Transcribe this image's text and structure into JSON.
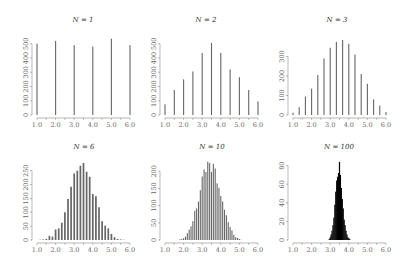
{
  "chart_data": [
    {
      "type": "bar",
      "title": "N = 1",
      "title_var": "N",
      "title_val": "1",
      "xlabel": "",
      "ylabel": "",
      "xlim": [
        1.0,
        6.0
      ],
      "xticks": [
        "1.0",
        "2.0",
        "3.0",
        "4.0",
        "5.0",
        "6.0"
      ],
      "yticks": [
        0,
        100,
        200,
        300,
        400,
        500
      ],
      "ylim": [
        0,
        540
      ],
      "x": [
        1.0,
        2.0,
        3.0,
        4.0,
        5.0,
        6.0
      ],
      "values": [
        500,
        520,
        490,
        480,
        535,
        490
      ],
      "fill": "#666666",
      "grid": false
    },
    {
      "type": "bar",
      "title": "N = 2",
      "title_var": "N",
      "title_val": "2",
      "xlabel": "",
      "ylabel": "",
      "xlim": [
        1.0,
        6.0
      ],
      "xticks": [
        "1.0",
        "2.0",
        "3.0",
        "4.0",
        "5.0",
        "6.0"
      ],
      "yticks": [
        0,
        100,
        200,
        300,
        400,
        500
      ],
      "ylim": [
        0,
        540
      ],
      "x": [
        1.0,
        1.5,
        2.0,
        2.5,
        3.0,
        3.5,
        4.0,
        4.5,
        5.0,
        5.5,
        6.0
      ],
      "values": [
        75,
        175,
        250,
        305,
        435,
        505,
        435,
        320,
        265,
        175,
        95
      ],
      "fill": "#666666",
      "grid": false
    },
    {
      "type": "bar",
      "title": "N = 3",
      "title_var": "N",
      "title_val": "3",
      "xlabel": "",
      "ylabel": "",
      "xlim": [
        1.0,
        6.0
      ],
      "xticks": [
        "1.0",
        "2.0",
        "3.0",
        "4.0",
        "5.0",
        "6.0"
      ],
      "yticks": [
        0,
        100,
        200,
        300
      ],
      "ylim": [
        0,
        395
      ],
      "x": [
        1.0,
        1.333,
        1.667,
        2.0,
        2.333,
        2.667,
        3.0,
        3.333,
        3.667,
        4.0,
        4.333,
        4.667,
        5.0,
        5.333,
        5.667,
        6.0
      ],
      "values": [
        12,
        40,
        95,
        135,
        205,
        290,
        345,
        375,
        385,
        365,
        310,
        210,
        160,
        80,
        48,
        15
      ],
      "fill": "#666666",
      "grid": false
    },
    {
      "type": "bar",
      "title": "N = 6",
      "title_var": "N",
      "title_val": "6",
      "xlabel": "",
      "ylabel": "",
      "xlim": [
        1.0,
        6.0
      ],
      "xticks": [
        "1.0",
        "2.0",
        "3.0",
        "4.0",
        "5.0",
        "6.0"
      ],
      "yticks": [
        0,
        50,
        100,
        150,
        200,
        250
      ],
      "ylim": [
        0,
        285
      ],
      "x": [
        1.167,
        1.333,
        1.5,
        1.667,
        1.833,
        2.0,
        2.167,
        2.333,
        2.5,
        2.667,
        2.833,
        3.0,
        3.167,
        3.333,
        3.5,
        3.667,
        3.833,
        4.0,
        4.167,
        4.333,
        4.5,
        4.667,
        4.833,
        5.0,
        5.167,
        5.333,
        5.5,
        5.667
      ],
      "values": [
        1,
        2,
        4,
        15,
        12,
        38,
        42,
        62,
        100,
        148,
        192,
        240,
        250,
        268,
        278,
        246,
        228,
        166,
        158,
        118,
        68,
        52,
        42,
        22,
        10,
        4,
        2,
        1
      ],
      "fill": "#666666",
      "grid": false
    },
    {
      "type": "bar",
      "title": "N = 10",
      "title_var": "N",
      "title_val": "10",
      "xlabel": "",
      "ylabel": "",
      "xlim": [
        1.0,
        6.0
      ],
      "xticks": [
        "1.0",
        "2.0",
        "3.0",
        "4.0",
        "5.0",
        "6.0"
      ],
      "yticks": [
        0,
        50,
        100,
        150,
        200
      ],
      "ylim": [
        0,
        230
      ],
      "x": [
        1.8,
        1.9,
        2.0,
        2.1,
        2.2,
        2.3,
        2.4,
        2.5,
        2.6,
        2.7,
        2.8,
        2.9,
        3.0,
        3.1,
        3.2,
        3.3,
        3.4,
        3.5,
        3.6,
        3.7,
        3.8,
        3.9,
        4.0,
        4.1,
        4.2,
        4.3,
        4.4,
        4.5,
        4.6,
        4.7,
        4.8,
        4.9,
        5.0,
        5.1
      ],
      "values": [
        2,
        3,
        5,
        10,
        20,
        30,
        40,
        55,
        85,
        92,
        112,
        145,
        185,
        205,
        198,
        228,
        224,
        198,
        222,
        208,
        165,
        152,
        128,
        112,
        88,
        72,
        52,
        38,
        28,
        15,
        8,
        6,
        3,
        1
      ],
      "fill": "#666666",
      "grid": false
    },
    {
      "type": "bar",
      "title": "N = 100",
      "title_var": "N",
      "title_val": "100",
      "xlabel": "",
      "ylabel": "",
      "xlim": [
        1.0,
        6.0
      ],
      "xticks": [
        "1.0",
        "2.0",
        "3.0",
        "4.0",
        "5.0",
        "6.0"
      ],
      "yticks": [
        0,
        20,
        40,
        60,
        80
      ],
      "ylim": [
        0,
        85
      ],
      "x": [
        2.95,
        3.0,
        3.05,
        3.1,
        3.15,
        3.2,
        3.25,
        3.3,
        3.35,
        3.4,
        3.45,
        3.5,
        3.55,
        3.6,
        3.65,
        3.7,
        3.75,
        3.8,
        3.85,
        3.9,
        3.95,
        4.0,
        4.05
      ],
      "values": [
        1,
        3,
        6,
        10,
        16,
        24,
        38,
        52,
        64,
        68,
        72,
        84,
        70,
        56,
        44,
        34,
        22,
        16,
        10,
        6,
        3,
        2,
        1
      ],
      "fill": "#000000",
      "grid": false
    }
  ],
  "layout": {
    "panels": [
      {
        "x0": 37,
        "x1": 130,
        "ybase": 115,
        "ytop": 38,
        "yaxis_x": 32,
        "title_x": 83,
        "title_y": 22
      },
      {
        "x0": 165,
        "x1": 258,
        "ybase": 115,
        "ytop": 38,
        "yaxis_x": 160,
        "title_x": 206,
        "title_y": 22
      },
      {
        "x0": 293,
        "x1": 386,
        "ybase": 115,
        "ytop": 38,
        "yaxis_x": 288,
        "title_x": 337,
        "title_y": 22
      },
      {
        "x0": 37,
        "x1": 130,
        "ybase": 240,
        "ytop": 161,
        "yaxis_x": 32,
        "title_x": 84,
        "title_y": 149
      },
      {
        "x0": 165,
        "x1": 258,
        "ybase": 240,
        "ytop": 161,
        "yaxis_x": 160,
        "title_x": 212,
        "title_y": 149
      },
      {
        "x0": 293,
        "x1": 386,
        "ybase": 240,
        "ytop": 161,
        "yaxis_x": 288,
        "title_x": 339,
        "title_y": 149
      }
    ]
  }
}
